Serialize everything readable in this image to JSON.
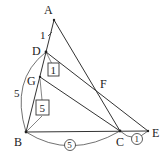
{
  "diagram": {
    "points": {
      "A": {
        "label": "A",
        "x": 54,
        "y": 20
      },
      "D": {
        "label": "D",
        "x": 46,
        "y": 52
      },
      "G": {
        "label": "G",
        "x": 40,
        "y": 77
      },
      "B": {
        "label": "B",
        "x": 26,
        "y": 132
      },
      "C": {
        "label": "C",
        "x": 120,
        "y": 131
      },
      "E": {
        "label": "E",
        "x": 148,
        "y": 131
      },
      "F": {
        "label": "F",
        "x": 96,
        "y": 89
      }
    },
    "segments": [
      "A-B",
      "A-C",
      "B-E",
      "D-E",
      "G-C",
      "B-D",
      "D-C"
    ],
    "annotations": {
      "AD": "1",
      "BD_arc": "5",
      "DG_box": "1",
      "GB_box": "5",
      "BC_circle": "5",
      "CE_circle": "1"
    },
    "stroke_color": "#333333"
  }
}
